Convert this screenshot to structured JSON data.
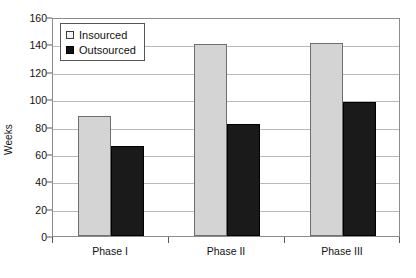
{
  "chart_data": {
    "type": "bar",
    "title": "",
    "subtitle": "",
    "xlabel": "",
    "ylabel": "Weeks",
    "categories": [
      "Phase I",
      "Phase II",
      "Phase III"
    ],
    "series": [
      {
        "name": "Insourced",
        "values": [
          88,
          140,
          141
        ],
        "color": "#d4d4d4"
      },
      {
        "name": "Outsourced",
        "values": [
          66,
          82,
          98
        ],
        "color": "#1a1a1a"
      }
    ],
    "ylim": [
      0,
      160
    ],
    "ytick_step": 20,
    "yticks": [
      0,
      20,
      40,
      60,
      80,
      100,
      120,
      140,
      160
    ],
    "ytick_labels": [
      "0",
      "20",
      "40",
      "60",
      "80",
      "100",
      "120",
      "140",
      "160"
    ],
    "grid": true,
    "grid_axis": "y",
    "legend_position": "upper left",
    "legend_inside_plot": true,
    "annotations": []
  },
  "legend": {
    "entries": [
      {
        "label": "Insourced",
        "swatch": "light-gray-square"
      },
      {
        "label": "Outsourced",
        "swatch": "black-square"
      }
    ]
  },
  "colors": {
    "insourced": "#d4d4d4",
    "outsourced": "#1a1a1a",
    "gridline": "#b9b9b9",
    "axis": "#8c8c8c",
    "text": "#111111",
    "background": "#ffffff"
  }
}
